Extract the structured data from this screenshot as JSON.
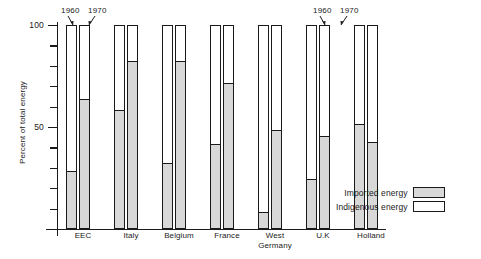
{
  "chart_data": {
    "type": "bar",
    "title": "",
    "xlabel": "",
    "ylabel": "Percent of total energy",
    "ylim": [
      0,
      100
    ],
    "ytick_labels": [
      "50",
      "100"
    ],
    "ytick_values": [
      50,
      100
    ],
    "minor_tick_interval": 10,
    "grid": false,
    "stacked": true,
    "legend_position": "bottom-right",
    "categories": [
      "EEC",
      "Italy",
      "Belgium",
      "France",
      "West Germany",
      "U.K",
      "Holland"
    ],
    "series": [
      {
        "name": "Imported energy",
        "color": "#d8d8d8",
        "years": [
          "1960",
          "1970"
        ],
        "values_1960": [
          28,
          58,
          32,
          41,
          8,
          24,
          51
        ],
        "values_1970": [
          63,
          82,
          82,
          71,
          48,
          45,
          42
        ]
      },
      {
        "name": "Indigenous energy",
        "color": "#ffffff",
        "years": [
          "1960",
          "1970"
        ],
        "values_1960": [
          72,
          42,
          68,
          59,
          92,
          76,
          49
        ],
        "values_1970": [
          37,
          18,
          18,
          29,
          52,
          55,
          58
        ]
      }
    ],
    "annotations": [
      {
        "label": "1960",
        "target": "EEC 1960 bar"
      },
      {
        "label": "1970",
        "target": "EEC 1970 bar"
      },
      {
        "label": "1960",
        "target": "Holland 1960 bar"
      },
      {
        "label": "1970",
        "target": "Holland 1970 bar"
      }
    ]
  },
  "legend": {
    "items": [
      {
        "label": "Imported energy",
        "swatch": "shaded"
      },
      {
        "label": "Indigenous energy",
        "swatch": "white"
      }
    ]
  },
  "axis": {
    "y_title": "Percent of total energy",
    "label_100": "100",
    "label_50": "50"
  },
  "groups": [
    {
      "label": "EEC",
      "label_line2": ""
    },
    {
      "label": "Italy",
      "label_line2": ""
    },
    {
      "label": "Belgium",
      "label_line2": ""
    },
    {
      "label": "France",
      "label_line2": ""
    },
    {
      "label": "West",
      "label_line2": "Germany"
    },
    {
      "label": "U.K",
      "label_line2": ""
    },
    {
      "label": "Holland",
      "label_line2": ""
    }
  ],
  "year_labels": {
    "left_1960": "1960",
    "left_1970": "1970",
    "right_1960": "1960",
    "right_1970": "1970"
  }
}
